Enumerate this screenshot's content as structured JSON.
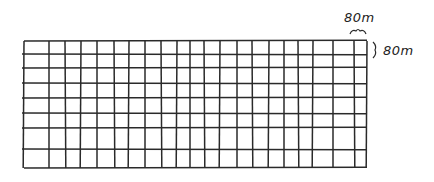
{
  "diagram": {
    "columns": 21,
    "rows": 8,
    "v_lines_x": [
      24,
      49,
      65,
      81,
      97,
      114,
      129,
      145,
      161,
      177,
      190,
      204,
      220,
      237,
      252,
      269,
      284,
      298,
      313,
      333,
      354,
      367
    ],
    "h_lines_y": [
      41,
      54,
      68,
      83,
      98,
      113,
      128,
      149,
      168
    ],
    "grid_left": 24,
    "grid_right": 367,
    "grid_top": 41,
    "grid_bottom": 168,
    "stroke_color": "#2a2a2a"
  },
  "annotations": {
    "width_label": "80m",
    "height_label": "80m"
  }
}
